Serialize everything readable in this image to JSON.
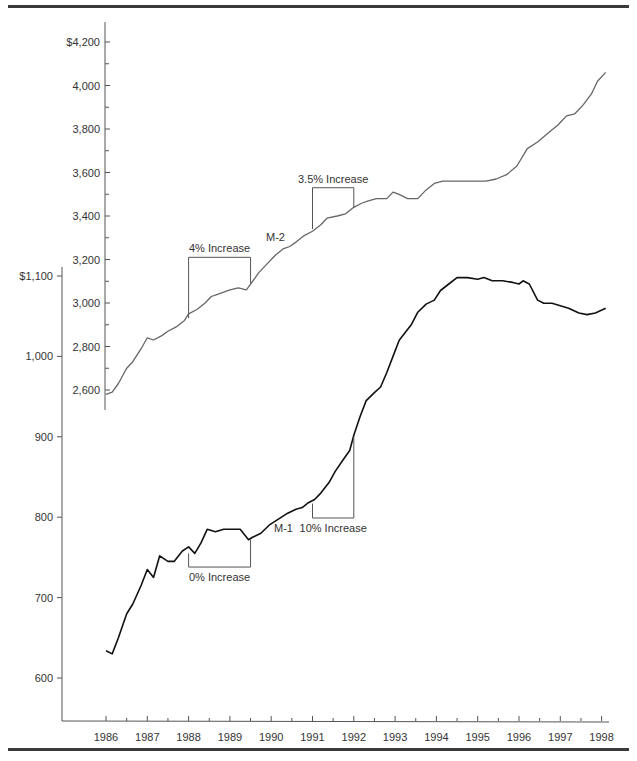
{
  "chart_data": {
    "type": "line",
    "title": "",
    "xlabel": "",
    "ylabel": "",
    "x_ticks": [
      "1986",
      "1987",
      "1988",
      "1989",
      "1990",
      "1991",
      "1992",
      "1993",
      "1994",
      "1995",
      "1996",
      "1997",
      "1998"
    ],
    "xlim": [
      1985.3,
      1998.2
    ],
    "legend": "none (inline series labels)",
    "grid": false,
    "axes": [
      {
        "name": "M-2 axis",
        "series": "M-2",
        "ticks": [
          "$4,200",
          "4,000",
          "3,800",
          "3,600",
          "3,400",
          "3,200",
          "3,000",
          "2,800",
          "2,600"
        ],
        "tick_values": [
          4200,
          4000,
          3800,
          3600,
          3400,
          3200,
          3000,
          2800,
          2600
        ],
        "ylim": [
          2550,
          4250
        ]
      },
      {
        "name": "M-1 axis",
        "series": "M-1",
        "ticks": [
          "$1,100",
          "1,000",
          "900",
          "800",
          "700",
          "600"
        ],
        "tick_values": [
          1100,
          1000,
          900,
          800,
          700,
          600
        ],
        "ylim": [
          550,
          1140
        ]
      }
    ],
    "series": [
      {
        "name": "M-2",
        "color": "#666666",
        "x": [
          1986.0,
          1986.15,
          1986.3,
          1986.5,
          1986.65,
          1986.85,
          1987.0,
          1987.15,
          1987.35,
          1987.5,
          1987.7,
          1987.9,
          1988.0,
          1988.2,
          1988.4,
          1988.55,
          1988.7,
          1988.85,
          1989.0,
          1989.2,
          1989.4,
          1989.55,
          1989.7,
          1989.9,
          1990.1,
          1990.3,
          1990.45,
          1990.6,
          1990.8,
          1991.0,
          1991.2,
          1991.35,
          1991.6,
          1991.8,
          1992.0,
          1992.2,
          1992.35,
          1992.55,
          1992.8,
          1992.95,
          1993.1,
          1993.3,
          1993.55,
          1993.75,
          1993.95,
          1994.15,
          1994.35,
          1994.55,
          1994.75,
          1995.0,
          1995.2,
          1995.45,
          1995.7,
          1995.95,
          1996.2,
          1996.45,
          1996.7,
          1996.95,
          1997.15,
          1997.35,
          1997.55,
          1997.75,
          1997.9,
          1998.1
        ],
        "values": [
          2580,
          2590,
          2630,
          2700,
          2730,
          2790,
          2840,
          2830,
          2850,
          2870,
          2890,
          2920,
          2950,
          2970,
          3000,
          3030,
          3040,
          3050,
          3060,
          3070,
          3060,
          3100,
          3140,
          3180,
          3220,
          3250,
          3260,
          3280,
          3310,
          3330,
          3360,
          3390,
          3400,
          3410,
          3440,
          3460,
          3470,
          3480,
          3480,
          3510,
          3500,
          3480,
          3480,
          3520,
          3550,
          3560,
          3560,
          3560,
          3560,
          3560,
          3560,
          3570,
          3590,
          3630,
          3710,
          3740,
          3780,
          3820,
          3860,
          3870,
          3910,
          3960,
          4020,
          4060
        ]
      },
      {
        "name": "M-1",
        "color": "#111111",
        "x": [
          1986.0,
          1986.15,
          1986.3,
          1986.5,
          1986.65,
          1986.85,
          1987.0,
          1987.15,
          1987.3,
          1987.5,
          1987.65,
          1987.85,
          1988.0,
          1988.15,
          1988.3,
          1988.45,
          1988.65,
          1988.85,
          1989.0,
          1989.25,
          1989.45,
          1989.55,
          1989.75,
          1989.95,
          1990.1,
          1990.25,
          1990.4,
          1990.6,
          1990.75,
          1990.9,
          1991.05,
          1991.2,
          1991.4,
          1991.55,
          1991.75,
          1991.9,
          1992.0,
          1992.15,
          1992.3,
          1992.5,
          1992.65,
          1992.8,
          1992.95,
          1993.1,
          1993.25,
          1993.4,
          1993.55,
          1993.75,
          1993.95,
          1994.1,
          1994.3,
          1994.5,
          1994.75,
          1995.0,
          1995.15,
          1995.35,
          1995.6,
          1995.85,
          1996.0,
          1996.1,
          1996.25,
          1996.45,
          1996.6,
          1996.8,
          1997.0,
          1997.2,
          1997.45,
          1997.65,
          1997.85,
          1998.1
        ],
        "values": [
          634,
          630,
          650,
          680,
          692,
          715,
          735,
          725,
          752,
          745,
          745,
          758,
          763,
          755,
          768,
          785,
          782,
          785,
          785,
          785,
          772,
          775,
          780,
          790,
          795,
          800,
          805,
          810,
          812,
          818,
          822,
          830,
          843,
          857,
          872,
          883,
          902,
          925,
          945,
          955,
          962,
          980,
          1000,
          1020,
          1030,
          1040,
          1055,
          1065,
          1070,
          1082,
          1090,
          1098,
          1098,
          1096,
          1098,
          1094,
          1094,
          1092,
          1090,
          1094,
          1090,
          1070,
          1066,
          1066,
          1063,
          1060,
          1054,
          1052,
          1054,
          1060
        ]
      }
    ],
    "annotations": [
      {
        "text": "4% Increase",
        "series": "M-2",
        "x_range": [
          1988.0,
          1989.5
        ]
      },
      {
        "text": "3.5% Increase",
        "series": "M-2",
        "x_range": [
          1991.0,
          1992.0
        ]
      },
      {
        "text": "0% Increase",
        "series": "M-1",
        "x_range": [
          1988.0,
          1989.5
        ]
      },
      {
        "text": "10% Increase",
        "series": "M-1",
        "x_range": [
          1991.0,
          1992.0
        ]
      },
      {
        "text": "M-2",
        "kind": "series-label"
      },
      {
        "text": "M-1",
        "kind": "series-label"
      }
    ]
  }
}
